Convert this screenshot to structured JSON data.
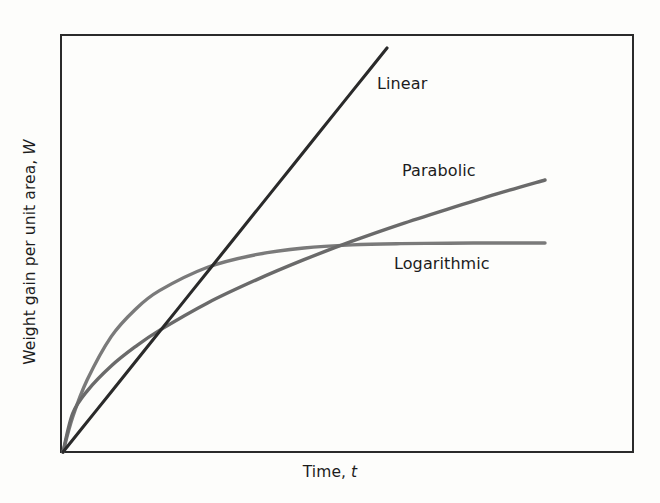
{
  "chart_data": {
    "type": "line",
    "title": "",
    "subtitle": "",
    "xlabel_text": "Time,",
    "xlabel_symbol": "t",
    "ylabel_text": "Weight gain per unit area,",
    "ylabel_symbol": "W",
    "grid": false,
    "legend_position": "inline-annotations",
    "axis_ticks": false,
    "xlim": [
      0,
      1
    ],
    "ylim": [
      0,
      1
    ],
    "frame": {
      "left": 61,
      "top": 35,
      "right": 633,
      "bottom": 452,
      "color": "#2b2b2b",
      "width": 2
    },
    "annotations": [
      {
        "name": "Linear",
        "x": 377,
        "y": 74
      },
      {
        "name": "Parabolic",
        "x": 402,
        "y": 161
      },
      {
        "name": "Logarithmic",
        "x": 394,
        "y": 254
      }
    ],
    "series": [
      {
        "name": "Linear",
        "law": "W = k*t",
        "color": "#2a2a2a",
        "line_width": 3.1,
        "x": [
          0.0,
          0.1,
          0.2,
          0.3,
          0.4,
          0.5,
          0.6,
          0.7,
          0.8,
          0.9,
          1.0
        ],
        "values": [
          0.0,
          0.1,
          0.2,
          0.3,
          0.4,
          0.5,
          0.6,
          0.7,
          0.8,
          0.9,
          1.0
        ],
        "x_end_px": 387,
        "y_end_px": 48
      },
      {
        "name": "Parabolic",
        "law": "W^2 = k*t",
        "color": "#6a6a6a",
        "line_width": 3.4,
        "x": [
          0.0,
          0.02,
          0.05,
          0.1,
          0.15,
          0.2,
          0.3,
          0.4,
          0.5,
          0.6,
          0.7,
          0.8,
          0.9,
          1.0
        ],
        "values": [
          0.0,
          0.141,
          0.224,
          0.316,
          0.387,
          0.447,
          0.548,
          0.632,
          0.707,
          0.775,
          0.837,
          0.894,
          0.949,
          1.0
        ],
        "x_end_px": 545,
        "y_end_px": 180
      },
      {
        "name": "Logarithmic",
        "law": "W = k*log(c*t + 1)",
        "color": "#7a7a7a",
        "line_width": 3.4,
        "x": [
          0.0,
          0.02,
          0.05,
          0.1,
          0.15,
          0.2,
          0.3,
          0.4,
          0.5,
          0.6,
          0.7,
          0.8,
          0.9,
          1.0
        ],
        "values": [
          0.0,
          0.166,
          0.344,
          0.552,
          0.682,
          0.772,
          0.884,
          0.944,
          0.976,
          0.991,
          0.997,
          0.999,
          1.0,
          1.0
        ],
        "x_end_px": 545,
        "y_end_px": 243
      }
    ]
  },
  "labels": {
    "linear": "Linear",
    "parabolic": "Parabolic",
    "logarithmic": "Logarithmic",
    "xaxis_text": "Time,",
    "xaxis_symbol": "t",
    "yaxis_text": "Weight gain per unit area,",
    "yaxis_symbol": "W"
  }
}
